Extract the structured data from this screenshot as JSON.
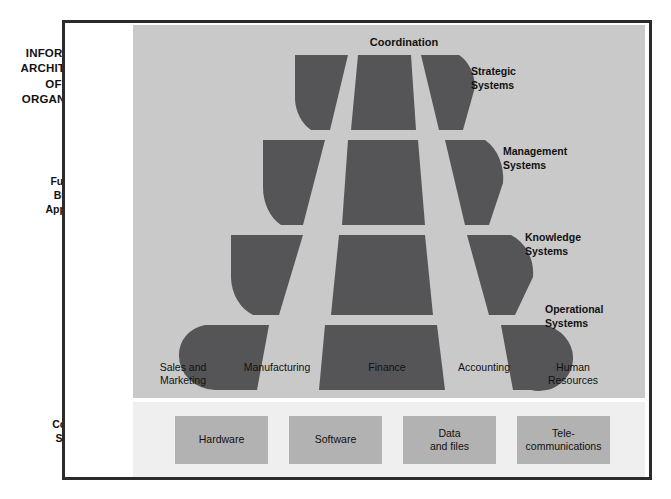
{
  "figure": {
    "left_captions": {
      "title": "INFORMATION ARCHITECTURE OF THE ORGANIZATION",
      "title_lines": [
        "INFORMATION",
        "ARCHITECTURE",
        "OF THE",
        "ORGANIZATION"
      ],
      "functional_business_applications": "Functional Business Applications",
      "computer_systems_base": "Computer Systems Base"
    },
    "pyramid": {
      "top_label": "Coordination",
      "tiers": [
        {
          "id": "strategic",
          "label": "Strategic Systems",
          "label_lines": [
            "Strategic",
            "Systems"
          ]
        },
        {
          "id": "management",
          "label": "Management Systems",
          "label_lines": [
            "Management",
            "Systems"
          ]
        },
        {
          "id": "knowledge",
          "label": "Knowledge Systems",
          "label_lines": [
            "Knowledge",
            "Systems"
          ]
        },
        {
          "id": "operational",
          "label": "Operational Systems",
          "label_lines": [
            "Operational",
            "Systems"
          ]
        }
      ],
      "columns": [
        {
          "id": "sales-and-marketing",
          "label": "Sales and Marketing",
          "label_lines": [
            "Sales and",
            "Marketing"
          ]
        },
        {
          "id": "manufacturing",
          "label": "Manufacturing",
          "label_lines": [
            "Manufacturing",
            ""
          ]
        },
        {
          "id": "finance",
          "label": "Finance",
          "label_lines": [
            "Finance",
            ""
          ]
        },
        {
          "id": "accounting",
          "label": "Accounting",
          "label_lines": [
            "Accounting",
            ""
          ]
        },
        {
          "id": "human-resources",
          "label": "Human Resources",
          "label_lines": [
            "Human",
            "Resources"
          ]
        }
      ]
    },
    "base_boxes": [
      {
        "id": "hardware",
        "label": "Hardware",
        "label_lines": [
          "Hardware",
          ""
        ]
      },
      {
        "id": "software",
        "label": "Software",
        "label_lines": [
          "Software",
          ""
        ]
      },
      {
        "id": "data-and-files",
        "label": "Data and files",
        "label_lines": [
          "Data",
          "and files"
        ]
      },
      {
        "id": "telecommunications",
        "label": "Tele-communications",
        "label_lines": [
          "Tele-",
          "communications"
        ]
      }
    ],
    "colors": {
      "panel_background": "#c9c9c9",
      "shape_fill": "#555558",
      "base_background": "#efefef",
      "base_box_fill": "#b2b2b2",
      "frame_border": "#2b2b2b",
      "text": "#111111"
    }
  }
}
